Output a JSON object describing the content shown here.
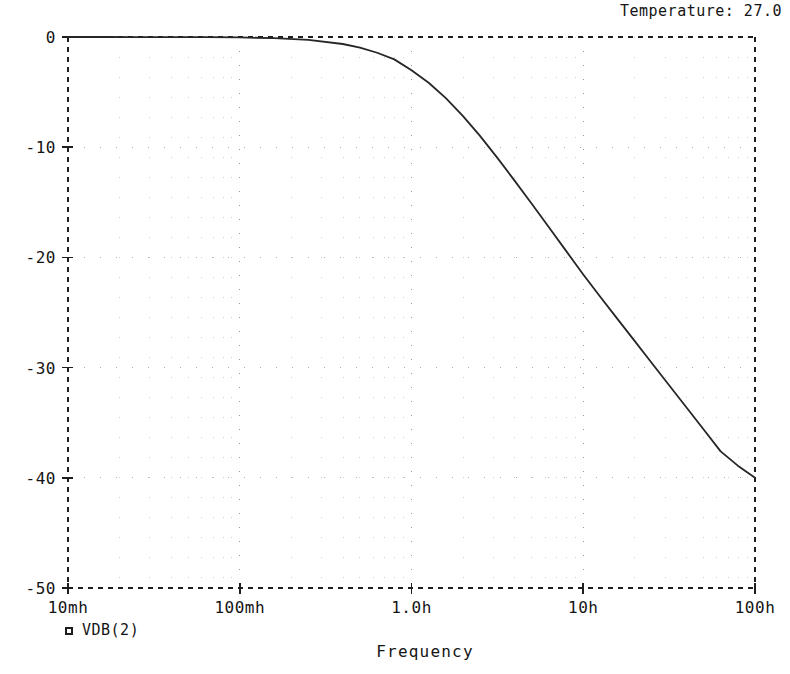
{
  "window": {
    "title": "Temperature: 27.0"
  },
  "chart_data": {
    "type": "line",
    "title": "Temperature: 27.0",
    "xlabel": "Frequency",
    "ylabel": "",
    "xscale": "log",
    "xlim": [
      0.01,
      100
    ],
    "ylim": [
      -50,
      0
    ],
    "grid": true,
    "grid_style": "dotted",
    "legend_position": "bottom-left",
    "xtick_labels": [
      "10mh",
      "100mh",
      "1.0h",
      "10h",
      "100h"
    ],
    "xtick_values": [
      0.01,
      0.1,
      1.0,
      10,
      100
    ],
    "ytick_labels": [
      "0",
      "-10",
      "-20",
      "-30",
      "-40",
      "-50"
    ],
    "ytick_values": [
      0,
      -10,
      -20,
      -30,
      -40,
      -50
    ],
    "series": [
      {
        "name": "VDB(2)",
        "marker": "square",
        "color": "#262626",
        "x": [
          0.01,
          0.0159,
          0.0251,
          0.0398,
          0.0631,
          0.1,
          0.1585,
          0.2512,
          0.3981,
          0.5012,
          0.631,
          0.7943,
          1.0,
          1.2589,
          1.5849,
          1.9953,
          2.5119,
          3.1623,
          3.9811,
          5.0119,
          6.3096,
          7.9433,
          10.0,
          12.589,
          15.849,
          19.953,
          25.119,
          31.623,
          39.811,
          50.119,
          63.096,
          79.433,
          100.0
        ],
        "y": [
          -0.0004,
          -0.001,
          -0.0027,
          -0.0069,
          -0.017,
          -0.043,
          -0.107,
          -0.265,
          -0.635,
          -0.969,
          -1.43,
          -2.03,
          -3.01,
          -4.15,
          -5.55,
          -7.18,
          -9.0,
          -10.97,
          -13.03,
          -15.13,
          -17.26,
          -19.41,
          -21.55,
          -23.6,
          -25.6,
          -27.6,
          -29.6,
          -31.6,
          -33.6,
          -35.6,
          -37.6,
          -38.9,
          -40.0
        ]
      }
    ],
    "annotations": []
  },
  "legend": {
    "entries": [
      {
        "marker": "square",
        "label": "VDB(2)"
      }
    ]
  },
  "axes": {
    "x_axis_name": "Frequency",
    "y_axis_name": ""
  }
}
